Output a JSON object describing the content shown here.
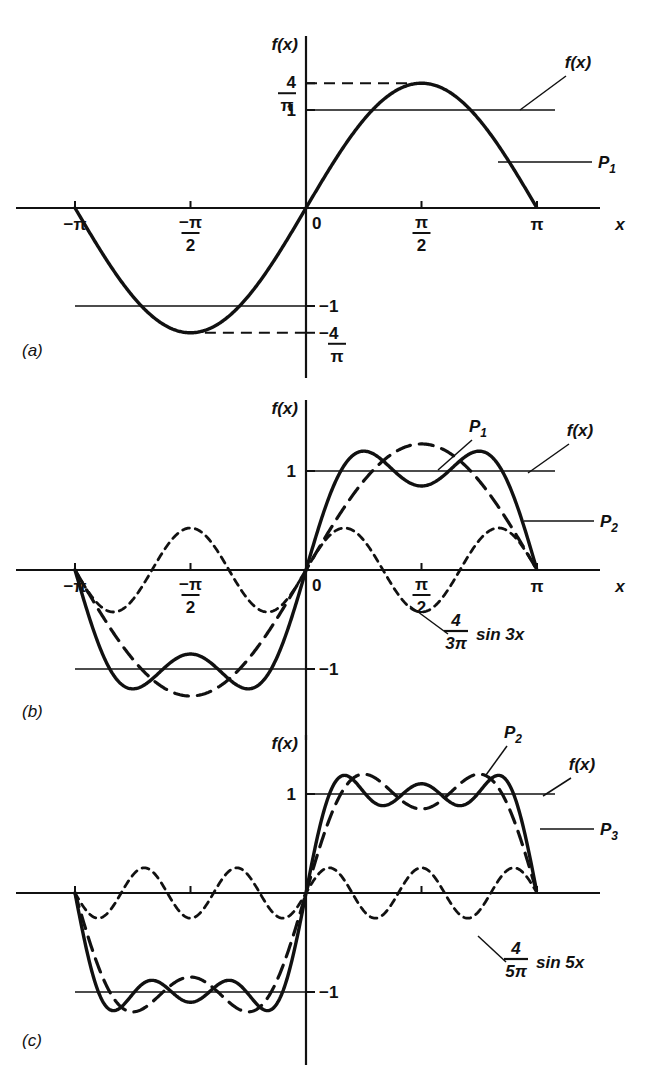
{
  "figure": {
    "background": "#ffffff",
    "ink": "#111111"
  },
  "panels": [
    {
      "letter": "(a)",
      "y_axis_label": "f(x)",
      "x_axis_label": "x",
      "x_ticks": [
        {
          "label_num": "−π",
          "label_den": "",
          "value": -3.14159
        },
        {
          "label_num": "−π",
          "label_den": "2",
          "value": -1.5708
        },
        {
          "label_num": "0",
          "label_den": "",
          "value": 0
        },
        {
          "label_num": "π",
          "label_den": "2",
          "value": 1.5708
        },
        {
          "label_num": "π",
          "label_den": "",
          "value": 3.14159
        }
      ],
      "y_ticks": [
        {
          "num": "4",
          "den": "π",
          "value": 1.2732,
          "style": "dashed"
        },
        {
          "num": "1",
          "den": "",
          "value": 1,
          "style": "solid"
        },
        {
          "num": "−1",
          "den": "",
          "value": -1,
          "style": "solid"
        },
        {
          "num": "−4",
          "den": "π",
          "value": -1.2732,
          "style": "dashed"
        }
      ],
      "callouts": [
        {
          "label": "f(x)",
          "target": "level-line-plus-1"
        },
        {
          "label": "P",
          "sub": "1",
          "target": "first-partial-sum"
        }
      ],
      "curves": [
        {
          "name": "P1",
          "expr": "(4/pi) sin x",
          "style": "solid-heavy",
          "harmonics": [
            1
          ]
        },
        {
          "name": "f(x)",
          "expr": "square wave level ±1",
          "style": "solid-light"
        }
      ]
    },
    {
      "letter": "(b)",
      "y_axis_label": "f(x)",
      "x_axis_label": "x",
      "x_ticks": [
        {
          "label_num": "−π",
          "label_den": "",
          "value": -3.14159
        },
        {
          "label_num": "−π",
          "label_den": "2",
          "value": -1.5708
        },
        {
          "label_num": "0",
          "label_den": "",
          "value": 0
        },
        {
          "label_num": "π",
          "label_den": "2",
          "value": 1.5708
        },
        {
          "label_num": "π",
          "label_den": "",
          "value": 3.14159
        }
      ],
      "y_ticks": [
        {
          "num": "1",
          "den": "",
          "value": 1,
          "style": "solid"
        },
        {
          "num": "−1",
          "den": "",
          "value": -1,
          "style": "solid"
        }
      ],
      "callouts": [
        {
          "label": "P",
          "sub": "1",
          "target": "first-partial-sum"
        },
        {
          "label": "f(x)",
          "target": "level-line-plus-1"
        },
        {
          "label": "P",
          "sub": "2",
          "target": "second-partial-sum"
        },
        {
          "label_frac_num": "4",
          "label_frac_den": "3π",
          "label_tail": "sin 3x",
          "target": "third-harmonic"
        }
      ],
      "curves": [
        {
          "name": "P1",
          "expr": "(4/pi) sin x",
          "style": "long-dashed",
          "harmonics": [
            1
          ]
        },
        {
          "name": "P2",
          "expr": "(4/pi)(sin x + sin 3x / 3)",
          "style": "solid-heavy",
          "harmonics": [
            1,
            3
          ]
        },
        {
          "name": "4/(3pi) sin 3x",
          "expr": "(4/(3pi)) sin 3x",
          "style": "short-dashed",
          "harmonics": [
            3
          ]
        }
      ]
    },
    {
      "letter": "(c)",
      "y_axis_label": "f(x)",
      "x_axis_label": "",
      "x_ticks": [
        {
          "label_num": "",
          "label_den": "",
          "value": -3.14159
        },
        {
          "label_num": "",
          "label_den": "",
          "value": -1.5708
        },
        {
          "label_num": "",
          "label_den": "",
          "value": 0
        },
        {
          "label_num": "",
          "label_den": "",
          "value": 1.5708
        },
        {
          "label_num": "",
          "label_den": "",
          "value": 3.14159
        }
      ],
      "y_ticks": [
        {
          "num": "1",
          "den": "",
          "value": 1,
          "style": "solid"
        },
        {
          "num": "−1",
          "den": "",
          "value": -1,
          "style": "solid"
        }
      ],
      "callouts": [
        {
          "label": "P",
          "sub": "2",
          "target": "second-partial-sum"
        },
        {
          "label": "f(x)",
          "target": "level-line-plus-1"
        },
        {
          "label": "P",
          "sub": "3",
          "target": "third-partial-sum"
        },
        {
          "label_frac_num": "4",
          "label_frac_den": "5π",
          "label_tail": "sin 5x",
          "target": "fifth-harmonic"
        }
      ],
      "curves": [
        {
          "name": "P2",
          "expr": "(4/pi)(sin x + sin 3x / 3)",
          "style": "long-dashed",
          "harmonics": [
            1,
            3
          ]
        },
        {
          "name": "P3",
          "expr": "(4/pi)(sin x + sin 3x/3 + sin 5x/5)",
          "style": "solid-heavy",
          "harmonics": [
            1,
            3,
            5
          ]
        },
        {
          "name": "4/(5pi) sin 5x",
          "expr": "(4/(5pi)) sin 5x",
          "style": "short-dashed",
          "harmonics": [
            5
          ]
        }
      ]
    }
  ],
  "chart_data": {
    "type": "line",
    "xlabel": "x",
    "ylabel": "f(x)",
    "xlim": [
      -3.6,
      3.9
    ],
    "x_tick_values": [
      -3.14159,
      -1.5708,
      0,
      1.5708,
      3.14159
    ],
    "x_tick_labels": [
      "−π",
      "−π/2",
      "0",
      "π/2",
      "π"
    ],
    "grid": false,
    "legend": "inline callouts",
    "panels": [
      {
        "name": "(a)",
        "ylim": [
          -1.55,
          1.55
        ],
        "y_tick_values": [
          1.2732,
          1,
          -1,
          -1.2732
        ],
        "y_tick_labels": [
          "4/π",
          "1",
          "−1",
          "−4/π"
        ],
        "series": [
          {
            "name": "P1",
            "formula": "(4/π) sin x",
            "amplitude": 1.2732,
            "harmonics": [
              {
                "n": 1,
                "coef": 1.2732
              }
            ],
            "style": "solid"
          },
          {
            "name": "f(x)",
            "formula": "square wave ±1",
            "levels": [
              1,
              -1
            ],
            "style": "solid-thin"
          }
        ]
      },
      {
        "name": "(b)",
        "ylim": [
          -1.55,
          1.55
        ],
        "y_tick_values": [
          1,
          -1
        ],
        "y_tick_labels": [
          "1",
          "−1"
        ],
        "series": [
          {
            "name": "P1",
            "formula": "(4/π) sin x",
            "harmonics": [
              {
                "n": 1,
                "coef": 1.2732
              }
            ],
            "style": "long-dashed"
          },
          {
            "name": "P2",
            "formula": "(4/π)(sin x + (1/3) sin 3x)",
            "harmonics": [
              {
                "n": 1,
                "coef": 1.2732
              },
              {
                "n": 3,
                "coef": 0.4244
              }
            ],
            "style": "solid"
          },
          {
            "name": "(4/3π) sin 3x",
            "formula": "(4/3π) sin 3x",
            "harmonics": [
              {
                "n": 3,
                "coef": 0.4244
              }
            ],
            "style": "short-dashed"
          },
          {
            "name": "f(x)",
            "formula": "square wave ±1",
            "levels": [
              1,
              -1
            ],
            "style": "solid-thin"
          }
        ]
      },
      {
        "name": "(c)",
        "ylim": [
          -1.55,
          1.55
        ],
        "y_tick_values": [
          1,
          -1
        ],
        "y_tick_labels": [
          "1",
          "−1"
        ],
        "series": [
          {
            "name": "P2",
            "formula": "(4/π)(sin x + (1/3) sin 3x)",
            "harmonics": [
              {
                "n": 1,
                "coef": 1.2732
              },
              {
                "n": 3,
                "coef": 0.4244
              }
            ],
            "style": "long-dashed"
          },
          {
            "name": "P3",
            "formula": "(4/π)(sin x + (1/3) sin 3x + (1/5) sin 5x)",
            "harmonics": [
              {
                "n": 1,
                "coef": 1.2732
              },
              {
                "n": 3,
                "coef": 0.4244
              },
              {
                "n": 5,
                "coef": 0.2546
              }
            ],
            "style": "solid"
          },
          {
            "name": "(4/5π) sin 5x",
            "formula": "(4/5π) sin 5x",
            "harmonics": [
              {
                "n": 5,
                "coef": 0.2546
              }
            ],
            "style": "short-dashed"
          },
          {
            "name": "f(x)",
            "formula": "square wave ±1",
            "levels": [
              1,
              -1
            ],
            "style": "solid-thin"
          }
        ]
      }
    ]
  }
}
